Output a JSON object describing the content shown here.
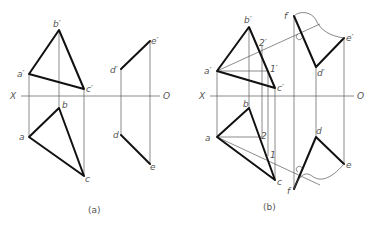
{
  "figures": [
    {
      "id": "a",
      "caption": "(a)",
      "axis": {
        "left_label": "X",
        "right_label": "O"
      },
      "labels": {
        "b_prime": "b′",
        "a_prime": "a′",
        "c_prime": "c′",
        "b": "b",
        "a": "a",
        "c": "c",
        "d_prime": "d′",
        "e_prime": "e′",
        "d": "d",
        "e": "e"
      }
    },
    {
      "id": "b",
      "caption": "(b)",
      "axis": {
        "left_label": "X",
        "right_label": "O"
      },
      "labels": {
        "b_prime": "b′",
        "a_prime": "a′",
        "c_prime": "c′",
        "two_prime": "2′",
        "one_prime": "1′",
        "b": "b",
        "a": "a",
        "c": "c",
        "two": "2",
        "one": "1",
        "f_prime": "f′",
        "d_prime": "d′",
        "e_prime": "e′",
        "d": "d",
        "e": "e",
        "f": "f"
      }
    }
  ]
}
